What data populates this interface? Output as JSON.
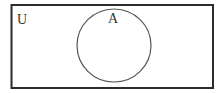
{
  "diagram": {
    "type": "venn",
    "universe_label": "U",
    "sets": [
      {
        "label": "A"
      }
    ],
    "colors": {
      "background": "#ffffff",
      "stroke": "#2b2b2b",
      "text": "#333333"
    }
  }
}
